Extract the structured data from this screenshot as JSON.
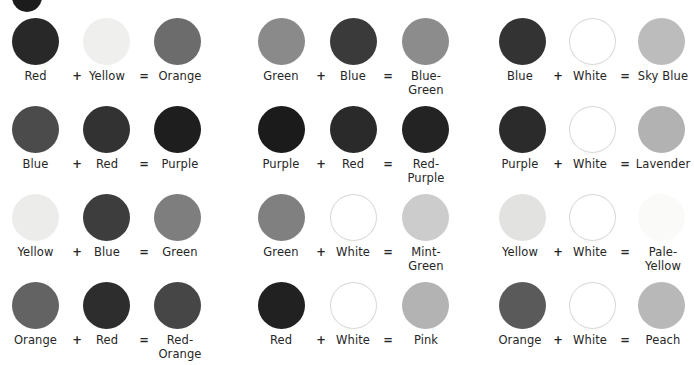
{
  "page": {
    "operator_plus": "+",
    "operator_equals": "="
  },
  "decor": {
    "top_crop_circle": {
      "name": "cropped-circle",
      "color": "#1c1c1c"
    }
  },
  "columns": [
    {
      "id": "column-1",
      "equations": [
        {
          "a": {
            "label": "Red",
            "color": "#282828"
          },
          "b": {
            "label": "Yellow",
            "color": "#efefee"
          },
          "result": {
            "label": "Orange",
            "color": "#6c6c6c"
          }
        },
        {
          "a": {
            "label": "Blue",
            "color": "#4b4b4b"
          },
          "b": {
            "label": "Red",
            "color": "#323232"
          },
          "result": {
            "label": "Purple",
            "color": "#1e1e1e"
          }
        },
        {
          "a": {
            "label": "Yellow",
            "color": "#ececea"
          },
          "b": {
            "label": "Blue",
            "color": "#3d3d3d"
          },
          "result": {
            "label": "Green",
            "color": "#7e7e7e"
          }
        },
        {
          "a": {
            "label": "Orange",
            "color": "#636363"
          },
          "b": {
            "label": "Red",
            "color": "#2d2d2d"
          },
          "result": {
            "label": "Red-\nOrange",
            "color": "#464646"
          }
        }
      ]
    },
    {
      "id": "column-2",
      "equations": [
        {
          "a": {
            "label": "Green",
            "color": "#8a8a8a"
          },
          "b": {
            "label": "Blue",
            "color": "#3a3a3a"
          },
          "result": {
            "label": "Blue-\nGreen",
            "color": "#8c8c8c"
          }
        },
        {
          "a": {
            "label": "Purple",
            "color": "#1b1b1b"
          },
          "b": {
            "label": "Red",
            "color": "#2a2a2a"
          },
          "result": {
            "label": "Red-\nPurple",
            "color": "#232323"
          }
        },
        {
          "a": {
            "label": "Green",
            "color": "#808080"
          },
          "b": {
            "label": "White",
            "color": "#ffffff"
          },
          "result": {
            "label": "Mint-\nGreen",
            "color": "#cccccc"
          }
        },
        {
          "a": {
            "label": "Red",
            "color": "#212121"
          },
          "b": {
            "label": "White",
            "color": "#ffffff"
          },
          "result": {
            "label": "Pink",
            "color": "#b3b3b3"
          }
        }
      ]
    },
    {
      "id": "column-3",
      "equations": [
        {
          "a": {
            "label": "Blue",
            "color": "#333333"
          },
          "b": {
            "label": "White",
            "color": "#ffffff"
          },
          "result": {
            "label": "Sky Blue",
            "color": "#bcbcbc"
          }
        },
        {
          "a": {
            "label": "Purple",
            "color": "#2b2b2b"
          },
          "b": {
            "label": "White",
            "color": "#ffffff"
          },
          "result": {
            "label": "Lavender",
            "color": "#b2b2b2"
          }
        },
        {
          "a": {
            "label": "Yellow",
            "color": "#e2e2e0"
          },
          "b": {
            "label": "White",
            "color": "#ffffff"
          },
          "result": {
            "label": "Pale-\nYellow",
            "color": "#fafaf8"
          }
        },
        {
          "a": {
            "label": "Orange",
            "color": "#5a5a5a"
          },
          "b": {
            "label": "White",
            "color": "#ffffff"
          },
          "result": {
            "label": "Peach",
            "color": "#b8b8b8"
          }
        }
      ]
    }
  ]
}
